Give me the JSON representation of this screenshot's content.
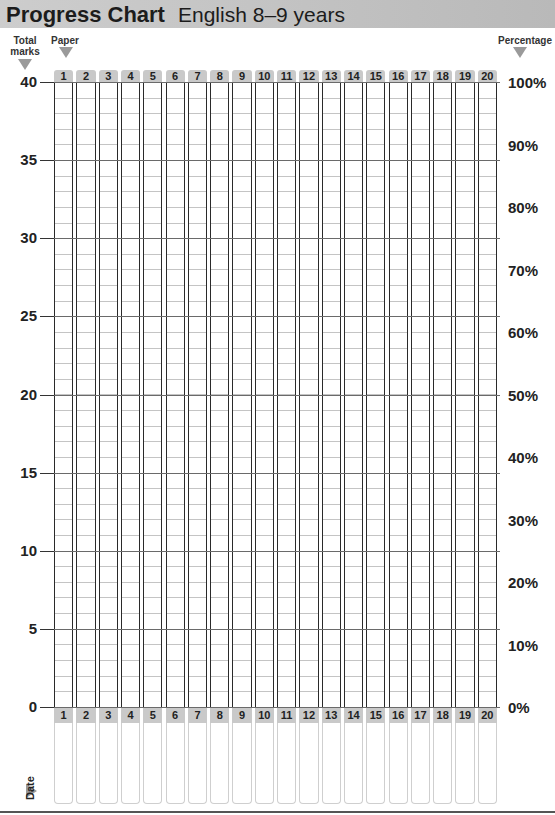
{
  "header": {
    "title": "Progress Chart",
    "subtitle": "English 8–9 years"
  },
  "labels": {
    "total_marks": "Total marks",
    "total_marks_l1": "Total",
    "total_marks_l2": "marks",
    "paper": "Paper",
    "percentage": "Percentage",
    "date": "Date"
  },
  "colors": {
    "header_bg": "#c4c4c4",
    "tab_bg": "#c9c9c9",
    "arrow": "#9a9a9a",
    "grid_border": "#2a2a2a",
    "grid_minor": "#c4c4c4"
  },
  "chart_data": {
    "type": "bar",
    "xlabel": "Paper",
    "ylabel": "Total marks",
    "y2label": "Percentage",
    "categories": [
      "1",
      "2",
      "3",
      "4",
      "5",
      "6",
      "7",
      "8",
      "9",
      "10",
      "11",
      "12",
      "13",
      "14",
      "15",
      "16",
      "17",
      "18",
      "19",
      "20"
    ],
    "values": [
      null,
      null,
      null,
      null,
      null,
      null,
      null,
      null,
      null,
      null,
      null,
      null,
      null,
      null,
      null,
      null,
      null,
      null,
      null,
      null
    ],
    "ylim": [
      0,
      40
    ],
    "y_ticks": [
      "40",
      "35",
      "30",
      "25",
      "20",
      "15",
      "10",
      "5",
      "0"
    ],
    "y2_ticks": [
      "100%",
      "90%",
      "80%",
      "70%",
      "60%",
      "50%",
      "40%",
      "30%",
      "20%",
      "10%",
      "0%"
    ],
    "grid": true,
    "minor_grid_step": 1,
    "note": "Blank fill-in chart; one empty column per paper with a date box below"
  }
}
